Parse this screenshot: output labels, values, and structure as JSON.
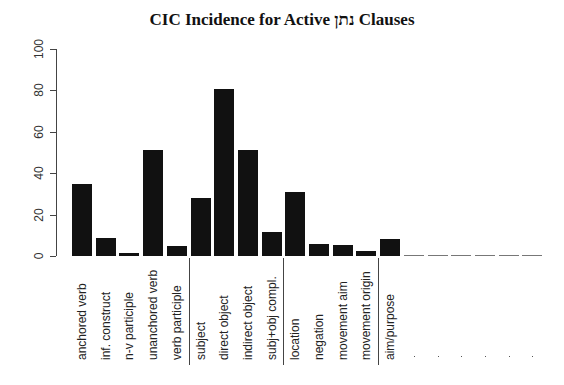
{
  "chart_data": {
    "type": "bar",
    "title": "CIC Incidence for Active נתן Clauses",
    "xlabel": "",
    "ylabel": "",
    "ylim": [
      0,
      100
    ],
    "yticks": [
      0,
      20,
      40,
      60,
      80,
      100
    ],
    "grid": false,
    "categories": [
      "anchored verb",
      "inf. construct",
      "n-v participle",
      "unanchored verb",
      "verb participle",
      "subject",
      "direct object",
      "indirect object",
      "subj+obj compl.",
      "location",
      "negation",
      "movement aim",
      "movement origin",
      "aim/purpose",
      ".",
      ".",
      ".",
      ".",
      ".",
      "."
    ],
    "values": [
      35,
      8.5,
      1.5,
      51,
      5,
      28,
      80.5,
      51,
      11.5,
      31,
      6,
      5.5,
      2.5,
      8,
      0,
      0,
      0,
      0,
      0,
      0
    ],
    "group_separators_after_index": [
      4,
      8,
      12
    ],
    "bar_color": "#111111"
  }
}
